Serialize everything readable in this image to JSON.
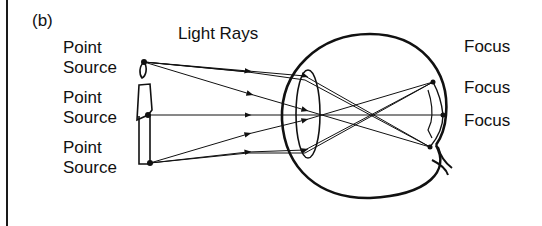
{
  "figure": {
    "panel_label": "(b)",
    "title": "Light Rays",
    "sources": [
      {
        "line1": "Point",
        "line2": "Source"
      },
      {
        "line1": "Point",
        "line2": "Source"
      },
      {
        "line1": "Point",
        "line2": "Source"
      }
    ],
    "focus_labels": [
      "Focus",
      "Focus",
      "Focus"
    ],
    "colors": {
      "ink": "#111111",
      "background": "#ffffff"
    }
  }
}
